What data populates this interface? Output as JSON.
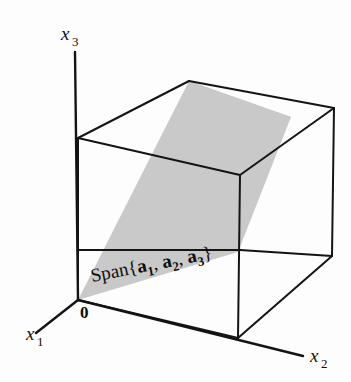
{
  "figure": {
    "type": "3d-coordinate-diagram",
    "background_color": "#fdfdfd",
    "line_color": "#111111",
    "plane_fill_color": "#c9c9c9"
  },
  "axes": {
    "x1": {
      "base": "x",
      "subscript": "1"
    },
    "x2": {
      "base": "x",
      "subscript": "2"
    },
    "x3": {
      "base": "x",
      "subscript": "3"
    }
  },
  "origin": {
    "label": "0"
  },
  "span_label": {
    "prefix": "Span{",
    "vectors": [
      {
        "name": "a",
        "subscript": "1"
      },
      {
        "name": "a",
        "subscript": "2"
      },
      {
        "name": "a",
        "subscript": "3"
      }
    ],
    "separator": ", ",
    "suffix": "}",
    "full_text": "Span{a1, a2, a3}"
  },
  "geometry": {
    "cube_label": "reference cube",
    "plane_label": "shaded span plane"
  }
}
